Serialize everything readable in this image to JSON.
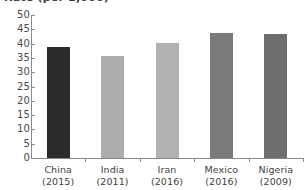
{
  "chart_data": {
    "type": "bar",
    "title": "Rate (per 1,000)",
    "title_clipped": true,
    "xlabel": "",
    "ylabel": "",
    "categories": [
      "China",
      "India",
      "Iran",
      "Mexico",
      "Nigeria"
    ],
    "category_years": [
      "(2015)",
      "(2011)",
      "(2016)",
      "(2016)",
      "(2009)"
    ],
    "values": [
      38.7,
      35.7,
      40.2,
      43.7,
      43.3
    ],
    "ylim": [
      0,
      50
    ],
    "ytick_step": 5,
    "yticks": [
      "50",
      "45",
      "40",
      "35",
      "30",
      "25",
      "20",
      "15",
      "10",
      "5",
      "0"
    ],
    "grid": false,
    "legend": "none",
    "bar_colors": [
      "#2b2b2b",
      "#adadad",
      "#b2b2b2",
      "#7a7a7a",
      "#6e6e6e"
    ],
    "axis_color": "#8a8a8a",
    "background": "#ffffff"
  }
}
